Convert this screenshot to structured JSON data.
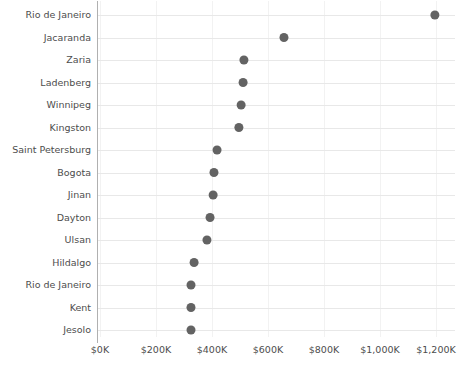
{
  "chart_data": {
    "type": "scatter",
    "title": "",
    "subtitle": "",
    "xlabel": "",
    "ylabel": "",
    "orientation": "horizontal",
    "grid": {
      "horizontal": true,
      "vertical": true
    },
    "legend": null,
    "xlim": [
      0,
      1260
    ],
    "x_tick_values": [
      0,
      200,
      400,
      600,
      800,
      1000,
      1200
    ],
    "x_tick_labels": [
      "$0K",
      "$200K",
      "$400K",
      "$600K",
      "$800K",
      "$1,000K",
      "$1,200K"
    ],
    "categories": [
      "Rio de Janeiro",
      "Jacaranda",
      "Zaria",
      "Ladenberg",
      "Winnipeg",
      "Kingston",
      "Saint Petersburg",
      "Bogota",
      "Jinan",
      "Dayton",
      "Ulsan",
      "Hildalgo",
      "Rio de Janeiro",
      "Kent",
      "Jesolo"
    ],
    "values": [
      1196,
      657,
      514,
      511,
      504,
      496,
      418,
      407,
      404,
      393,
      382,
      336,
      325,
      325,
      325
    ],
    "marker": {
      "shape": "circle",
      "color": "#636363",
      "radius": 4.5
    },
    "colors": {
      "marker": "#636363",
      "gridline": "#e8e8e8",
      "vertical_gridline": "#f2f2f2",
      "axis": "#b0b0b0",
      "text": "#4d4d4d",
      "background": "#ffffff"
    }
  }
}
